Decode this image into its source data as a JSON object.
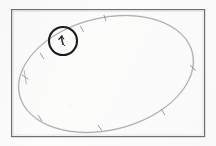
{
  "figure": {
    "kind": "scanned-line-figure",
    "caption": "",
    "background_color": "#fcfcfb",
    "ink_color": "#8b8b90",
    "frame": {
      "label": "figure-border",
      "color": "#6e6e73",
      "stroke_width": 1.2,
      "x": 11,
      "y": 9,
      "width": 194,
      "height": 128
    },
    "curve": {
      "label": "closed-orbit-curve",
      "type": "rotated-ellipse",
      "color": "#9a9a9f",
      "stroke_width": 0.9,
      "center_x": 106,
      "center_y": 74,
      "radius_x": 89,
      "radius_y": 56,
      "rotation_deg": -14
    },
    "highlight_circle": {
      "label": "highlight-annotation",
      "color": "#1b1b1b",
      "stroke_width": 2.1,
      "center_x": 63,
      "center_y": 41,
      "radius": 14
    },
    "marker": {
      "label": "point-marker-arrow",
      "color": "#2a2a2a",
      "x": 62,
      "y": 41
    },
    "tick_marks": {
      "label": "curve-sample-ticks",
      "color": "#8e8e93",
      "count": 9,
      "points": [
        {
          "x": 105,
          "y": 18,
          "angle": 18
        },
        {
          "x": 82,
          "y": 29,
          "angle": 28
        },
        {
          "x": 63,
          "y": 41,
          "angle": 34
        },
        {
          "x": 42,
          "y": 56,
          "angle": 48
        },
        {
          "x": 25,
          "y": 77,
          "angle": 86
        },
        {
          "x": 40,
          "y": 118,
          "angle": 130
        },
        {
          "x": 100,
          "y": 128,
          "angle": 172
        },
        {
          "x": 163,
          "y": 112,
          "angle": 208
        },
        {
          "x": 193,
          "y": 68,
          "angle": 268
        }
      ]
    }
  },
  "accessibility": {
    "alt_text": "Scanned diagram: a thin rectangular frame containing a tilted closed oval curve with small tick marks; a bold circle highlights a marked point on the upper-left part of the curve."
  }
}
